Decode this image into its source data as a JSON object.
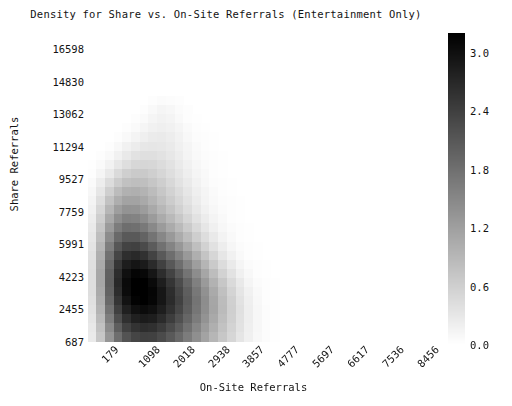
{
  "chart_data": {
    "type": "heatmap",
    "title": "Density for Share vs. On-Site Referrals (Entertainment Only)",
    "xlabel": "On-Site Referrals",
    "ylabel": "Share Referrals",
    "grid": false,
    "legend_position": "right",
    "colormap": "greys",
    "colorbar": {
      "label": "",
      "ticks": [
        "0.0",
        "0.6",
        "1.2",
        "1.8",
        "2.4",
        "3.0"
      ],
      "tick_values": [
        0.0,
        0.6,
        1.2,
        1.8,
        2.4,
        3.0
      ],
      "vmin": 0.0,
      "vmax": 3.2
    },
    "x_tick_labels": [
      "179",
      "1098",
      "2018",
      "2938",
      "3857",
      "4777",
      "5697",
      "6617",
      "7536",
      "8456"
    ],
    "x_tick_values": [
      179,
      1098,
      2018,
      2938,
      3857,
      4777,
      5697,
      6617,
      7536,
      8456
    ],
    "y_tick_labels": [
      "687",
      "2455",
      "4223",
      "5991",
      "7759",
      "9527",
      "11294",
      "13062",
      "14830",
      "16598"
    ],
    "y_tick_values": [
      687,
      2455,
      4223,
      5991,
      7759,
      9527,
      11294,
      13062,
      14830,
      16598
    ],
    "xlim": [
      179,
      8916
    ],
    "ylim": [
      687,
      17482
    ],
    "nx": 38,
    "ny": 34,
    "note": "values are density estimates per grid cell, 0.0 (white) to ~3.2 (black)",
    "values": [
      [
        0.0,
        0.0,
        0.0,
        0.0,
        0.0,
        0.0,
        0.0,
        0.0,
        0.0,
        0.0,
        0.0,
        0.0,
        0.0,
        0.0,
        0.0,
        0.0,
        0.0,
        0.0,
        0.0,
        0.0,
        0.0,
        0.0,
        0.0,
        0.0,
        0.0,
        0.0,
        0.0,
        0.0,
        0.0,
        0.0,
        0.0,
        0.0,
        0.0,
        0.0,
        0.0,
        0.0,
        0.0,
        0.0
      ],
      [
        0.0,
        0.0,
        0.0,
        0.0,
        0.0,
        0.0,
        0.0,
        0.0,
        0.0,
        0.0,
        0.0,
        0.0,
        0.0,
        0.0,
        0.0,
        0.0,
        0.0,
        0.0,
        0.0,
        0.0,
        0.0,
        0.0,
        0.0,
        0.0,
        0.0,
        0.0,
        0.0,
        0.0,
        0.0,
        0.0,
        0.0,
        0.0,
        0.0,
        0.0,
        0.0,
        0.0,
        0.0,
        0.0
      ],
      [
        0.0,
        0.0,
        0.0,
        0.0,
        0.0,
        0.0,
        0.0,
        0.0,
        0.0,
        0.0,
        0.0,
        0.0,
        0.0,
        0.0,
        0.0,
        0.0,
        0.0,
        0.0,
        0.0,
        0.0,
        0.0,
        0.0,
        0.0,
        0.0,
        0.0,
        0.0,
        0.0,
        0.0,
        0.0,
        0.0,
        0.0,
        0.0,
        0.0,
        0.0,
        0.0,
        0.0,
        0.0,
        0.0
      ],
      [
        0.0,
        0.0,
        0.0,
        0.0,
        0.0,
        0.0,
        0.0,
        0.0,
        0.0,
        0.0,
        0.0,
        0.0,
        0.0,
        0.0,
        0.0,
        0.0,
        0.0,
        0.0,
        0.0,
        0.0,
        0.0,
        0.0,
        0.0,
        0.0,
        0.0,
        0.0,
        0.0,
        0.0,
        0.0,
        0.0,
        0.0,
        0.0,
        0.0,
        0.0,
        0.0,
        0.0,
        0.0,
        0.0
      ],
      [
        0.0,
        0.0,
        0.0,
        0.0,
        0.0,
        0.0,
        0.0,
        0.0,
        0.0,
        0.0,
        0.0,
        0.0,
        0.0,
        0.0,
        0.0,
        0.0,
        0.0,
        0.0,
        0.0,
        0.0,
        0.0,
        0.0,
        0.0,
        0.0,
        0.0,
        0.0,
        0.0,
        0.0,
        0.0,
        0.0,
        0.0,
        0.0,
        0.0,
        0.0,
        0.0,
        0.0,
        0.0,
        0.0
      ],
      [
        0.0,
        0.0,
        0.0,
        0.0,
        0.0,
        0.0,
        0.0,
        0.0,
        0.0,
        0.0,
        0.0,
        0.0,
        0.0,
        0.0,
        0.0,
        0.0,
        0.0,
        0.0,
        0.0,
        0.0,
        0.0,
        0.0,
        0.0,
        0.0,
        0.0,
        0.0,
        0.0,
        0.0,
        0.0,
        0.0,
        0.0,
        0.0,
        0.0,
        0.0,
        0.0,
        0.0,
        0.0,
        0.0
      ],
      [
        0.0,
        0.0,
        0.0,
        0.0,
        0.0,
        0.0,
        0.0,
        0.0,
        0.0,
        0.0,
        0.0,
        0.0,
        0.0,
        0.0,
        0.0,
        0.0,
        0.0,
        0.0,
        0.0,
        0.0,
        0.0,
        0.0,
        0.0,
        0.0,
        0.0,
        0.0,
        0.0,
        0.0,
        0.0,
        0.0,
        0.0,
        0.0,
        0.0,
        0.0,
        0.0,
        0.0,
        0.0,
        0.0
      ],
      [
        0.0,
        0.0,
        0.0,
        0.0,
        0.0,
        0.0,
        0.0,
        0.03,
        0.05,
        0.04,
        0.02,
        0.0,
        0.0,
        0.0,
        0.0,
        0.0,
        0.0,
        0.0,
        0.0,
        0.0,
        0.0,
        0.0,
        0.0,
        0.0,
        0.0,
        0.0,
        0.0,
        0.0,
        0.0,
        0.0,
        0.0,
        0.0,
        0.0,
        0.0,
        0.0,
        0.0,
        0.0,
        0.0
      ],
      [
        0.0,
        0.0,
        0.0,
        0.0,
        0.0,
        0.0,
        0.03,
        0.08,
        0.12,
        0.1,
        0.05,
        0.02,
        0.0,
        0.0,
        0.0,
        0.0,
        0.0,
        0.0,
        0.0,
        0.0,
        0.0,
        0.0,
        0.0,
        0.0,
        0.0,
        0.0,
        0.0,
        0.0,
        0.0,
        0.0,
        0.0,
        0.0,
        0.0,
        0.0,
        0.0,
        0.0,
        0.0,
        0.0
      ],
      [
        0.0,
        0.0,
        0.0,
        0.0,
        0.0,
        0.02,
        0.06,
        0.12,
        0.16,
        0.14,
        0.08,
        0.03,
        0.01,
        0.0,
        0.0,
        0.0,
        0.0,
        0.0,
        0.0,
        0.0,
        0.0,
        0.0,
        0.0,
        0.0,
        0.0,
        0.0,
        0.0,
        0.0,
        0.0,
        0.0,
        0.0,
        0.0,
        0.0,
        0.0,
        0.0,
        0.0,
        0.0,
        0.0
      ],
      [
        0.0,
        0.0,
        0.0,
        0.0,
        0.02,
        0.06,
        0.12,
        0.18,
        0.2,
        0.18,
        0.12,
        0.06,
        0.02,
        0.01,
        0.0,
        0.0,
        0.0,
        0.0,
        0.0,
        0.0,
        0.0,
        0.0,
        0.0,
        0.0,
        0.0,
        0.0,
        0.0,
        0.0,
        0.0,
        0.0,
        0.0,
        0.0,
        0.0,
        0.0,
        0.0,
        0.0,
        0.0,
        0.0
      ],
      [
        0.0,
        0.0,
        0.0,
        0.03,
        0.08,
        0.14,
        0.2,
        0.25,
        0.26,
        0.22,
        0.16,
        0.09,
        0.04,
        0.02,
        0.01,
        0.0,
        0.0,
        0.0,
        0.0,
        0.0,
        0.0,
        0.0,
        0.0,
        0.0,
        0.0,
        0.0,
        0.0,
        0.0,
        0.0,
        0.0,
        0.0,
        0.0,
        0.0,
        0.0,
        0.0,
        0.0,
        0.0,
        0.0
      ],
      [
        0.0,
        0.0,
        0.03,
        0.09,
        0.17,
        0.24,
        0.3,
        0.32,
        0.3,
        0.26,
        0.19,
        0.12,
        0.06,
        0.03,
        0.01,
        0.0,
        0.0,
        0.0,
        0.0,
        0.0,
        0.0,
        0.0,
        0.0,
        0.0,
        0.0,
        0.0,
        0.0,
        0.0,
        0.0,
        0.0,
        0.0,
        0.0,
        0.0,
        0.0,
        0.0,
        0.0,
        0.0,
        0.0
      ],
      [
        0.0,
        0.02,
        0.08,
        0.18,
        0.28,
        0.36,
        0.4,
        0.4,
        0.36,
        0.3,
        0.22,
        0.14,
        0.08,
        0.04,
        0.02,
        0.01,
        0.0,
        0.0,
        0.0,
        0.0,
        0.0,
        0.0,
        0.0,
        0.0,
        0.0,
        0.0,
        0.0,
        0.0,
        0.0,
        0.0,
        0.0,
        0.0,
        0.0,
        0.0,
        0.0,
        0.0,
        0.0,
        0.0
      ],
      [
        0.01,
        0.06,
        0.16,
        0.3,
        0.42,
        0.5,
        0.52,
        0.5,
        0.44,
        0.36,
        0.26,
        0.17,
        0.1,
        0.05,
        0.02,
        0.01,
        0.0,
        0.0,
        0.0,
        0.0,
        0.0,
        0.0,
        0.0,
        0.0,
        0.0,
        0.0,
        0.0,
        0.0,
        0.0,
        0.0,
        0.0,
        0.0,
        0.0,
        0.0,
        0.0,
        0.0,
        0.0,
        0.0
      ],
      [
        0.03,
        0.12,
        0.28,
        0.46,
        0.6,
        0.66,
        0.66,
        0.6,
        0.52,
        0.42,
        0.31,
        0.21,
        0.13,
        0.07,
        0.03,
        0.01,
        0.0,
        0.0,
        0.0,
        0.0,
        0.0,
        0.0,
        0.0,
        0.0,
        0.0,
        0.0,
        0.0,
        0.0,
        0.0,
        0.0,
        0.0,
        0.0,
        0.0,
        0.0,
        0.0,
        0.0,
        0.0,
        0.0
      ],
      [
        0.06,
        0.22,
        0.44,
        0.64,
        0.78,
        0.82,
        0.8,
        0.72,
        0.61,
        0.49,
        0.37,
        0.26,
        0.16,
        0.09,
        0.04,
        0.02,
        0.01,
        0.0,
        0.0,
        0.0,
        0.0,
        0.0,
        0.0,
        0.0,
        0.0,
        0.0,
        0.0,
        0.0,
        0.0,
        0.0,
        0.0,
        0.0,
        0.0,
        0.0,
        0.0,
        0.0,
        0.0,
        0.0
      ],
      [
        0.1,
        0.32,
        0.6,
        0.84,
        0.98,
        1.0,
        0.95,
        0.84,
        0.7,
        0.57,
        0.44,
        0.31,
        0.2,
        0.12,
        0.06,
        0.03,
        0.01,
        0.0,
        0.0,
        0.0,
        0.0,
        0.0,
        0.0,
        0.0,
        0.0,
        0.0,
        0.0,
        0.0,
        0.0,
        0.0,
        0.0,
        0.0,
        0.0,
        0.0,
        0.0,
        0.0,
        0.0,
        0.0
      ],
      [
        0.14,
        0.42,
        0.76,
        1.02,
        1.16,
        1.16,
        1.08,
        0.94,
        0.79,
        0.64,
        0.5,
        0.36,
        0.24,
        0.14,
        0.08,
        0.04,
        0.02,
        0.01,
        0.0,
        0.0,
        0.0,
        0.0,
        0.0,
        0.0,
        0.0,
        0.0,
        0.0,
        0.0,
        0.0,
        0.0,
        0.0,
        0.0,
        0.0,
        0.0,
        0.0,
        0.0,
        0.0,
        0.0
      ],
      [
        0.18,
        0.52,
        0.92,
        1.22,
        1.36,
        1.34,
        1.24,
        1.08,
        0.9,
        0.74,
        0.58,
        0.43,
        0.29,
        0.18,
        0.1,
        0.05,
        0.02,
        0.01,
        0.0,
        0.0,
        0.0,
        0.0,
        0.0,
        0.0,
        0.0,
        0.0,
        0.0,
        0.0,
        0.0,
        0.0,
        0.0,
        0.0,
        0.0,
        0.0,
        0.0,
        0.0,
        0.0,
        0.0
      ],
      [
        0.22,
        0.62,
        1.08,
        1.42,
        1.58,
        1.56,
        1.44,
        1.26,
        1.06,
        0.88,
        0.7,
        0.53,
        0.37,
        0.24,
        0.14,
        0.07,
        0.03,
        0.01,
        0.0,
        0.0,
        0.0,
        0.0,
        0.0,
        0.0,
        0.0,
        0.0,
        0.0,
        0.0,
        0.0,
        0.0,
        0.0,
        0.0,
        0.0,
        0.0,
        0.0,
        0.0,
        0.0,
        0.0
      ],
      [
        0.26,
        0.72,
        1.26,
        1.64,
        1.82,
        1.8,
        1.68,
        1.48,
        1.26,
        1.06,
        0.86,
        0.67,
        0.48,
        0.32,
        0.19,
        0.1,
        0.05,
        0.02,
        0.01,
        0.0,
        0.0,
        0.0,
        0.0,
        0.0,
        0.0,
        0.0,
        0.0,
        0.0,
        0.0,
        0.0,
        0.0,
        0.0,
        0.0,
        0.0,
        0.0,
        0.0,
        0.0,
        0.0
      ],
      [
        0.3,
        0.82,
        1.44,
        1.88,
        2.08,
        2.08,
        1.96,
        1.74,
        1.5,
        1.28,
        1.06,
        0.84,
        0.62,
        0.43,
        0.27,
        0.15,
        0.07,
        0.03,
        0.01,
        0.0,
        0.0,
        0.0,
        0.0,
        0.0,
        0.0,
        0.0,
        0.0,
        0.0,
        0.0,
        0.0,
        0.0,
        0.0,
        0.0,
        0.0,
        0.0,
        0.0,
        0.0,
        0.0
      ],
      [
        0.34,
        0.92,
        1.62,
        2.12,
        2.36,
        2.38,
        2.26,
        2.04,
        1.78,
        1.54,
        1.3,
        1.05,
        0.8,
        0.57,
        0.38,
        0.22,
        0.11,
        0.05,
        0.02,
        0.01,
        0.0,
        0.0,
        0.0,
        0.0,
        0.0,
        0.0,
        0.0,
        0.0,
        0.0,
        0.0,
        0.0,
        0.0,
        0.0,
        0.0,
        0.0,
        0.0,
        0.0,
        0.0
      ],
      [
        0.38,
        1.0,
        1.78,
        2.34,
        2.62,
        2.68,
        2.58,
        2.36,
        2.08,
        1.82,
        1.56,
        1.28,
        1.0,
        0.74,
        0.51,
        0.32,
        0.17,
        0.08,
        0.03,
        0.01,
        0.0,
        0.0,
        0.0,
        0.0,
        0.0,
        0.0,
        0.0,
        0.0,
        0.0,
        0.0,
        0.0,
        0.0,
        0.0,
        0.0,
        0.0,
        0.0,
        0.0,
        0.0
      ],
      [
        0.4,
        1.06,
        1.9,
        2.52,
        2.84,
        2.94,
        2.86,
        2.66,
        2.38,
        2.1,
        1.82,
        1.52,
        1.22,
        0.93,
        0.67,
        0.44,
        0.26,
        0.13,
        0.05,
        0.02,
        0.01,
        0.0,
        0.0,
        0.0,
        0.0,
        0.0,
        0.0,
        0.0,
        0.0,
        0.0,
        0.0,
        0.0,
        0.0,
        0.0,
        0.0,
        0.0,
        0.0,
        0.0
      ],
      [
        0.42,
        1.1,
        1.98,
        2.64,
        3.0,
        3.14,
        3.1,
        2.92,
        2.64,
        2.36,
        2.06,
        1.74,
        1.43,
        1.12,
        0.83,
        0.57,
        0.36,
        0.19,
        0.09,
        0.03,
        0.01,
        0.0,
        0.0,
        0.0,
        0.0,
        0.0,
        0.0,
        0.0,
        0.0,
        0.0,
        0.0,
        0.0,
        0.0,
        0.0,
        0.0,
        0.0,
        0.0,
        0.0
      ],
      [
        0.42,
        1.1,
        2.0,
        2.68,
        3.08,
        3.24,
        3.22,
        3.08,
        2.82,
        2.54,
        2.24,
        1.92,
        1.59,
        1.27,
        0.97,
        0.7,
        0.46,
        0.27,
        0.13,
        0.05,
        0.02,
        0.01,
        0.0,
        0.0,
        0.0,
        0.0,
        0.0,
        0.0,
        0.0,
        0.0,
        0.0,
        0.0,
        0.0,
        0.0,
        0.0,
        0.0,
        0.0,
        0.0
      ],
      [
        0.41,
        1.07,
        1.96,
        2.64,
        3.06,
        3.24,
        3.26,
        3.14,
        2.92,
        2.64,
        2.34,
        2.02,
        1.7,
        1.38,
        1.07,
        0.79,
        0.54,
        0.33,
        0.17,
        0.07,
        0.03,
        0.01,
        0.0,
        0.0,
        0.0,
        0.0,
        0.0,
        0.0,
        0.0,
        0.0,
        0.0,
        0.0,
        0.0,
        0.0,
        0.0,
        0.0,
        0.0,
        0.0
      ],
      [
        0.39,
        1.02,
        1.88,
        2.54,
        2.96,
        3.16,
        3.2,
        3.12,
        2.92,
        2.66,
        2.38,
        2.06,
        1.74,
        1.43,
        1.12,
        0.84,
        0.59,
        0.37,
        0.2,
        0.09,
        0.03,
        0.01,
        0.0,
        0.0,
        0.0,
        0.0,
        0.0,
        0.0,
        0.0,
        0.0,
        0.0,
        0.0,
        0.0,
        0.0,
        0.0,
        0.0,
        0.0,
        0.0
      ],
      [
        0.36,
        0.95,
        1.76,
        2.4,
        2.8,
        3.0,
        3.06,
        3.0,
        2.82,
        2.58,
        2.32,
        2.02,
        1.72,
        1.42,
        1.13,
        0.85,
        0.6,
        0.39,
        0.21,
        0.1,
        0.04,
        0.01,
        0.0,
        0.0,
        0.0,
        0.0,
        0.0,
        0.0,
        0.0,
        0.0,
        0.0,
        0.0,
        0.0,
        0.0,
        0.0,
        0.0,
        0.0,
        0.0
      ],
      [
        0.33,
        0.87,
        1.62,
        2.22,
        2.6,
        2.8,
        2.86,
        2.82,
        2.66,
        2.44,
        2.2,
        1.92,
        1.64,
        1.36,
        1.08,
        0.82,
        0.59,
        0.38,
        0.21,
        0.1,
        0.04,
        0.01,
        0.0,
        0.0,
        0.0,
        0.0,
        0.0,
        0.0,
        0.0,
        0.0,
        0.0,
        0.0,
        0.0,
        0.0,
        0.0,
        0.0,
        0.0,
        0.0
      ],
      [
        0.29,
        0.78,
        1.46,
        2.02,
        2.38,
        2.56,
        2.64,
        2.6,
        2.46,
        2.26,
        2.04,
        1.78,
        1.52,
        1.26,
        1.0,
        0.76,
        0.55,
        0.36,
        0.2,
        0.1,
        0.04,
        0.01,
        0.0,
        0.0,
        0.0,
        0.0,
        0.0,
        0.0,
        0.0,
        0.0,
        0.0,
        0.0,
        0.0,
        0.0,
        0.0,
        0.0,
        0.0,
        0.0
      ],
      [
        0.26,
        0.7,
        1.32,
        1.82,
        2.16,
        2.34,
        2.4,
        2.38,
        2.26,
        2.08,
        1.88,
        1.64,
        1.4,
        1.16,
        0.92,
        0.7,
        0.51,
        0.33,
        0.19,
        0.09,
        0.04,
        0.01,
        0.0,
        0.0,
        0.0,
        0.0,
        0.0,
        0.0,
        0.0,
        0.0,
        0.0,
        0.0,
        0.0,
        0.0,
        0.0,
        0.0,
        0.0,
        0.0
      ]
    ]
  }
}
